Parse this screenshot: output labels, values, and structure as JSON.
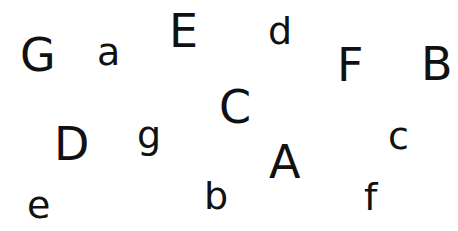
{
  "letters": [
    {
      "char": "G",
      "x": 20,
      "y": 32,
      "case": "cap"
    },
    {
      "char": "a",
      "x": 97,
      "y": 33,
      "case": "low"
    },
    {
      "char": "E",
      "x": 169,
      "y": 8,
      "case": "cap"
    },
    {
      "char": "d",
      "x": 268,
      "y": 12,
      "case": "low"
    },
    {
      "char": "F",
      "x": 337,
      "y": 42,
      "case": "cap"
    },
    {
      "char": "B",
      "x": 421,
      "y": 41,
      "case": "cap"
    },
    {
      "char": "C",
      "x": 219,
      "y": 84,
      "case": "cap"
    },
    {
      "char": "D",
      "x": 54,
      "y": 121,
      "case": "cap"
    },
    {
      "char": "g",
      "x": 137,
      "y": 116,
      "case": "low"
    },
    {
      "char": "e",
      "x": 27,
      "y": 186,
      "case": "low"
    },
    {
      "char": "b",
      "x": 204,
      "y": 177,
      "case": "low"
    },
    {
      "char": "A",
      "x": 269,
      "y": 139,
      "case": "cap"
    },
    {
      "char": "c",
      "x": 388,
      "y": 117,
      "case": "low"
    },
    {
      "char": "f",
      "x": 364,
      "y": 178,
      "case": "low"
    }
  ]
}
